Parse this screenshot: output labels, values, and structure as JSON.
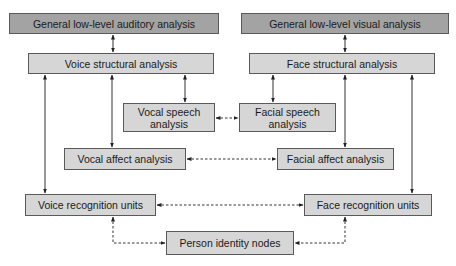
{
  "diagram": {
    "nodes": [
      {
        "id": "auditory",
        "label": "General low-level auditory analysis",
        "x": 9,
        "y": 13,
        "w": 210,
        "h": 21,
        "tone": "dark"
      },
      {
        "id": "visual",
        "label": "General low-level visual analysis",
        "x": 241,
        "y": 13,
        "w": 208,
        "h": 21,
        "tone": "dark"
      },
      {
        "id": "voice_struct",
        "label": "Voice structural analysis",
        "x": 28,
        "y": 53,
        "w": 186,
        "h": 21,
        "tone": "light"
      },
      {
        "id": "face_struct",
        "label": "Face structural analysis",
        "x": 249,
        "y": 53,
        "w": 186,
        "h": 21,
        "tone": "light"
      },
      {
        "id": "vocal_speech",
        "label": "Vocal speech analysis",
        "x": 123,
        "y": 103,
        "w": 92,
        "h": 29,
        "tone": "light"
      },
      {
        "id": "facial_speech",
        "label": "Facial speech analysis",
        "x": 239,
        "y": 103,
        "w": 97,
        "h": 29,
        "tone": "light"
      },
      {
        "id": "vocal_affect",
        "label": "Vocal affect analysis",
        "x": 64,
        "y": 148,
        "w": 122,
        "h": 22,
        "tone": "light"
      },
      {
        "id": "facial_affect",
        "label": "Facial affect analysis",
        "x": 277,
        "y": 148,
        "w": 117,
        "h": 22,
        "tone": "light"
      },
      {
        "id": "voice_rec",
        "label": "Voice recognition units",
        "x": 25,
        "y": 194,
        "w": 131,
        "h": 22,
        "tone": "light"
      },
      {
        "id": "face_rec",
        "label": "Face recognition units",
        "x": 304,
        "y": 194,
        "w": 128,
        "h": 22,
        "tone": "light"
      },
      {
        "id": "pin",
        "label": "Person identity nodes",
        "x": 166,
        "y": 231,
        "w": 128,
        "h": 24,
        "tone": "light"
      }
    ],
    "edges": [
      {
        "from": "auditory",
        "to": "voice_struct",
        "style": "solid",
        "dir": "both",
        "points": [
          [
            113,
            35
          ],
          [
            113,
            52
          ]
        ]
      },
      {
        "from": "visual",
        "to": "face_struct",
        "style": "solid",
        "dir": "both",
        "points": [
          [
            345,
            35
          ],
          [
            345,
            52
          ]
        ]
      },
      {
        "from": "voice_struct",
        "to": "voice_rec",
        "style": "solid",
        "dir": "both",
        "points": [
          [
            45,
            75
          ],
          [
            45,
            193
          ]
        ]
      },
      {
        "from": "voice_struct",
        "to": "vocal_affect",
        "style": "solid",
        "dir": "both",
        "points": [
          [
            112,
            75
          ],
          [
            112,
            147
          ]
        ]
      },
      {
        "from": "voice_struct",
        "to": "vocal_speech",
        "style": "solid",
        "dir": "both",
        "points": [
          [
            185,
            75
          ],
          [
            185,
            102
          ]
        ]
      },
      {
        "from": "face_struct",
        "to": "facial_speech",
        "style": "solid",
        "dir": "both",
        "points": [
          [
            273,
            75
          ],
          [
            273,
            102
          ]
        ]
      },
      {
        "from": "face_struct",
        "to": "facial_affect",
        "style": "solid",
        "dir": "both",
        "points": [
          [
            345,
            75
          ],
          [
            345,
            147
          ]
        ]
      },
      {
        "from": "face_struct",
        "to": "face_rec",
        "style": "solid",
        "dir": "both",
        "points": [
          [
            412,
            75
          ],
          [
            412,
            193
          ]
        ]
      },
      {
        "from": "vocal_speech",
        "to": "facial_speech",
        "style": "dashed",
        "dir": "both",
        "points": [
          [
            216,
            118
          ],
          [
            238,
            118
          ]
        ]
      },
      {
        "from": "vocal_affect",
        "to": "facial_affect",
        "style": "dashed",
        "dir": "both",
        "points": [
          [
            187,
            159
          ],
          [
            276,
            159
          ]
        ]
      },
      {
        "from": "voice_rec",
        "to": "face_rec",
        "style": "dashed",
        "dir": "both",
        "points": [
          [
            157,
            205
          ],
          [
            303,
            205
          ]
        ]
      },
      {
        "from": "voice_rec",
        "to": "pin",
        "style": "dashed",
        "dir": "both",
        "points": [
          [
            113,
            217
          ],
          [
            113,
            243
          ],
          [
            165,
            243
          ]
        ]
      },
      {
        "from": "face_rec",
        "to": "pin",
        "style": "dashed",
        "dir": "both",
        "points": [
          [
            345,
            217
          ],
          [
            345,
            243
          ],
          [
            295,
            243
          ]
        ]
      }
    ]
  }
}
